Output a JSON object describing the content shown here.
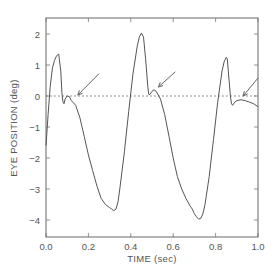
{
  "chart_data": {
    "type": "line",
    "title": "",
    "xlabel": "TIME (sec)",
    "ylabel": "EYE POSITION (deg)",
    "xlim": [
      0.0,
      1.0
    ],
    "ylim": [
      -4.55,
      2.5
    ],
    "x_ticks": [
      "0.0",
      "0.2",
      "0.4",
      "0.6",
      "0.8",
      "1.0"
    ],
    "y_ticks": [
      "2",
      "1",
      "0",
      "-1",
      "-2",
      "-3",
      "-4"
    ],
    "grid": false,
    "legend": null,
    "reference_line": {
      "y": 0,
      "style": "dotted"
    },
    "series": [
      {
        "name": "eye position",
        "x": [
          0.0,
          0.01,
          0.02,
          0.03,
          0.04,
          0.05,
          0.06,
          0.07,
          0.075,
          0.08,
          0.085,
          0.09,
          0.1,
          0.11,
          0.12,
          0.14,
          0.16,
          0.18,
          0.2,
          0.22,
          0.24,
          0.26,
          0.28,
          0.3,
          0.31,
          0.32,
          0.33,
          0.34,
          0.35,
          0.37,
          0.39,
          0.41,
          0.43,
          0.44,
          0.45,
          0.46,
          0.47,
          0.48,
          0.485,
          0.49,
          0.5,
          0.51,
          0.52,
          0.54,
          0.56,
          0.58,
          0.6,
          0.62,
          0.64,
          0.66,
          0.68,
          0.69,
          0.7,
          0.71,
          0.72,
          0.73,
          0.74,
          0.75,
          0.77,
          0.79,
          0.81,
          0.83,
          0.84,
          0.85,
          0.855,
          0.86,
          0.87,
          0.875,
          0.88,
          0.89,
          0.9,
          0.92,
          0.94,
          0.96,
          0.98,
          1.0
        ],
        "y": [
          -1.6,
          -0.6,
          0.3,
          0.9,
          1.15,
          1.3,
          1.35,
          0.8,
          0.1,
          -0.2,
          -0.25,
          -0.1,
          0.0,
          -0.02,
          -0.15,
          -0.3,
          -0.7,
          -1.3,
          -1.9,
          -2.4,
          -2.9,
          -3.3,
          -3.5,
          -3.6,
          -3.65,
          -3.7,
          -3.65,
          -3.4,
          -2.9,
          -1.8,
          -0.5,
          0.7,
          1.6,
          1.9,
          2.03,
          1.9,
          1.2,
          0.3,
          0.05,
          0.05,
          0.15,
          0.2,
          0.15,
          -0.1,
          -0.6,
          -1.3,
          -2.0,
          -2.6,
          -3.0,
          -3.3,
          -3.55,
          -3.65,
          -3.8,
          -3.9,
          -3.97,
          -3.95,
          -3.8,
          -3.5,
          -2.6,
          -1.4,
          -0.2,
          0.8,
          1.1,
          1.25,
          1.2,
          0.8,
          0.0,
          -0.25,
          -0.3,
          -0.2,
          -0.15,
          -0.12,
          -0.15,
          -0.2,
          -0.25,
          -0.35
        ]
      }
    ],
    "annotations": [
      {
        "type": "arrow",
        "from": [
          0.25,
          0.72
        ],
        "to": [
          0.15,
          0.03
        ],
        "label": ""
      },
      {
        "type": "arrow",
        "from": [
          0.61,
          0.78
        ],
        "to": [
          0.53,
          0.29
        ],
        "label": ""
      },
      {
        "type": "arrow",
        "from": [
          1.0,
          0.58
        ],
        "to": [
          0.93,
          0.0
        ],
        "label": ""
      }
    ]
  },
  "labels": {
    "xlabel": "TIME (sec)",
    "ylabel": "EYE POSITION (deg)",
    "x_ticks": [
      "0.0",
      "0.2",
      "0.4",
      "0.6",
      "0.8",
      "1.0"
    ],
    "y_ticks": [
      "2",
      "1",
      "0",
      "-1",
      "-2",
      "-3",
      "-4"
    ]
  }
}
